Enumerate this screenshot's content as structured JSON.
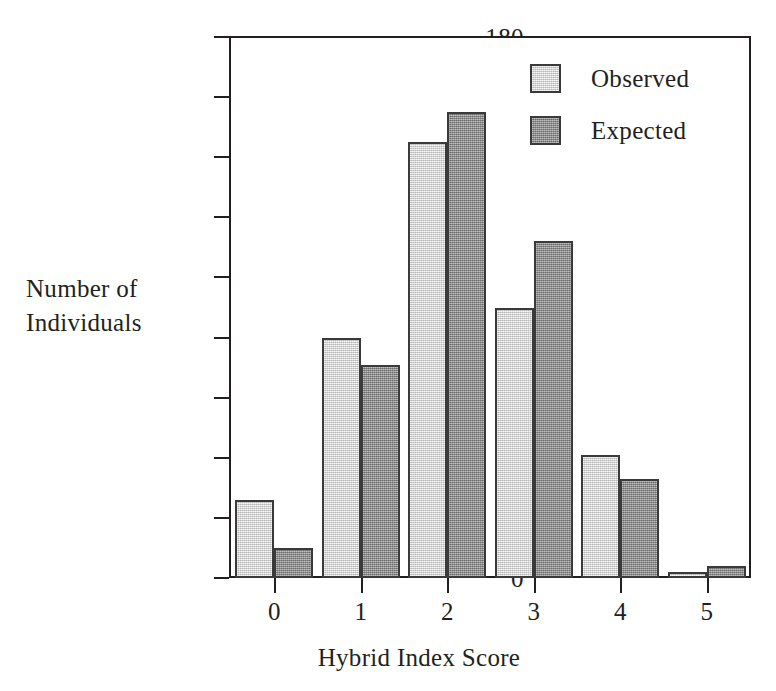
{
  "chart_data": {
    "type": "bar",
    "title": "",
    "xlabel": "Hybrid Index Score",
    "ylabel": "Number of\nIndividuals",
    "ylabel_lines": [
      "Number of",
      "Individuals"
    ],
    "categories": [
      "0",
      "1",
      "2",
      "3",
      "4",
      "5"
    ],
    "series": [
      {
        "name": "Observed",
        "color": "#d3d3d3",
        "values": [
          26,
          80,
          145,
          90,
          41,
          2
        ]
      },
      {
        "name": "Expected",
        "color": "#8d8d8d",
        "values": [
          10,
          71,
          155,
          112,
          33,
          4
        ]
      }
    ],
    "ylim": [
      0,
      180
    ],
    "ytick_values": [
      0,
      20,
      40,
      60,
      80,
      100,
      120,
      140,
      160,
      180
    ],
    "ytick_labels": [
      "0",
      "20",
      "40",
      "60",
      "80",
      "100",
      "120",
      "140",
      "160",
      "180"
    ],
    "xtick_labels": [
      "0",
      "1",
      "2",
      "3",
      "4",
      "5"
    ],
    "grid": false,
    "legend_position": "top-right",
    "legend_entries": [
      "Observed",
      "Expected"
    ],
    "axis_color": "#231f20",
    "bar_edge_color": "#3a3a3a"
  }
}
